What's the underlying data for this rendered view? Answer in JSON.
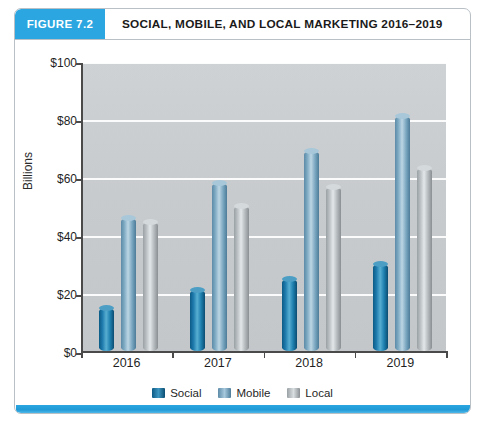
{
  "figure": {
    "badge": "FIGURE 7.2",
    "title": "SOCIAL, MOBILE, AND LOCAL MARKETING 2016–2019",
    "accent_color": "#2ba6e0"
  },
  "chart_data": {
    "type": "bar",
    "title": "SOCIAL, MOBILE, AND LOCAL MARKETING 2016–2019",
    "xlabel": "",
    "ylabel": "Billions",
    "ylim": [
      0,
      100
    ],
    "yticks": [
      "$0",
      "$20",
      "$40",
      "$60",
      "$80",
      "$100"
    ],
    "ytick_values": [
      0,
      20,
      40,
      60,
      80,
      100
    ],
    "grid": true,
    "legend_position": "bottom",
    "categories": [
      "2016",
      "2017",
      "2018",
      "2019"
    ],
    "series": [
      {
        "name": "Social",
        "color": "#1c79ab",
        "values": [
          15,
          21,
          25,
          30
        ]
      },
      {
        "name": "Mobile",
        "color": "#7aa7c0",
        "values": [
          46,
          58,
          69,
          81
        ]
      },
      {
        "name": "Local",
        "color": "#b6bcbf",
        "values": [
          44.5,
          50,
          56.5,
          63
        ]
      }
    ]
  }
}
